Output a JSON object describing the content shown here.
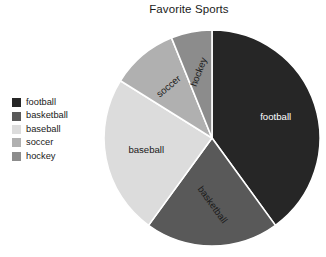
{
  "chart": {
    "title": "Favorite Sports"
  },
  "legend": {
    "items": [
      {
        "label": "football",
        "color": "#262626"
      },
      {
        "label": "basketball",
        "color": "#595959"
      },
      {
        "label": "baseball",
        "color": "#dcdcdc"
      },
      {
        "label": "soccer",
        "color": "#b0b0b0"
      },
      {
        "label": "hockey",
        "color": "#8c8c8c"
      }
    ]
  },
  "chart_data": {
    "type": "pie",
    "title": "Favorite Sports",
    "xlabel": "",
    "ylabel": "",
    "legend_position": "left",
    "grid": false,
    "start_angle_deg": 0,
    "direction": "clockwise",
    "categories": [
      "football",
      "basketball",
      "baseball",
      "soccer",
      "hockey"
    ],
    "values": [
      40,
      20,
      24,
      10,
      6
    ],
    "unit": "percent",
    "slices": [
      {
        "label": "football",
        "value": 40,
        "color": "#262626",
        "start_deg": 0,
        "end_deg": 144,
        "label_color": "#ffffff",
        "label_rotation_deg": 0
      },
      {
        "label": "basketball",
        "value": 20,
        "color": "#595959",
        "start_deg": 144,
        "end_deg": 216,
        "label_color": "#1a1a1a",
        "label_rotation_deg": 54
      },
      {
        "label": "baseball",
        "value": 24,
        "color": "#dcdcdc",
        "start_deg": 216,
        "end_deg": 302,
        "label_color": "#1a1a1a",
        "label_rotation_deg": 0
      },
      {
        "label": "soccer",
        "value": 10,
        "color": "#b0b0b0",
        "start_deg": 302,
        "end_deg": 338,
        "label_color": "#1a1a1a",
        "label_rotation_deg": -40
      },
      {
        "label": "hockey",
        "value": 6,
        "color": "#8c8c8c",
        "start_deg": 338,
        "end_deg": 360,
        "label_color": "#1a1a1a",
        "label_rotation_deg": -69
      }
    ]
  },
  "pie_geometry": {
    "cx": 111,
    "cy": 112,
    "r": 108,
    "separator_color": "#ffffff",
    "separator_width": 1.6,
    "label_radius_factor": 0.62
  }
}
